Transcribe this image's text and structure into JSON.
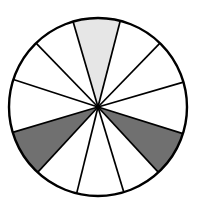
{
  "diagram": {
    "type": "divided-circle",
    "sector_count": 12,
    "center": [
      98,
      107
    ],
    "radius": 89,
    "colors": {
      "background": "#ffffff",
      "stroke": "#000000",
      "light_shade": "#e6e6e6",
      "dark_shade": "#707070",
      "unshaded": "#ffffff"
    },
    "spoke_endpoints": [
      [
        72,
        18
      ],
      [
        121,
        18
      ],
      [
        160,
        43
      ],
      [
        184,
        82
      ],
      [
        184,
        134
      ],
      [
        160,
        174
      ],
      [
        125,
        196
      ],
      [
        76,
        196
      ],
      [
        38,
        172
      ],
      [
        14,
        132
      ],
      [
        15,
        80
      ],
      [
        36,
        43
      ]
    ],
    "sectors": [
      {
        "from": 0,
        "to": 1,
        "fill": "light_shade"
      },
      {
        "from": 1,
        "to": 2,
        "fill": "unshaded"
      },
      {
        "from": 2,
        "to": 3,
        "fill": "unshaded"
      },
      {
        "from": 3,
        "to": 4,
        "fill": "unshaded"
      },
      {
        "from": 4,
        "to": 5,
        "fill": "dark_shade"
      },
      {
        "from": 5,
        "to": 6,
        "fill": "unshaded"
      },
      {
        "from": 6,
        "to": 7,
        "fill": "unshaded"
      },
      {
        "from": 7,
        "to": 8,
        "fill": "unshaded"
      },
      {
        "from": 8,
        "to": 9,
        "fill": "dark_shade"
      },
      {
        "from": 9,
        "to": 10,
        "fill": "unshaded"
      },
      {
        "from": 10,
        "to": 11,
        "fill": "unshaded"
      },
      {
        "from": 11,
        "to": 0,
        "fill": "unshaded"
      }
    ],
    "shaded_summary": {
      "light_sectors": 1,
      "dark_sectors": 2,
      "unshaded_sectors": 9
    }
  }
}
